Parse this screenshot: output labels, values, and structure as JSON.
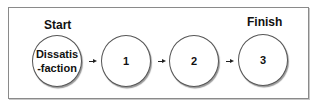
{
  "diagram": {
    "start_label": "Start",
    "finish_label": "Finish",
    "nodes": [
      {
        "id": "dissatisfaction",
        "label": "Dissatis\n-faction"
      },
      {
        "id": "step-1",
        "label": "1"
      },
      {
        "id": "step-2",
        "label": "2"
      },
      {
        "id": "step-3",
        "label": "3"
      }
    ],
    "edges": [
      {
        "from": "dissatisfaction",
        "to": "step-1"
      },
      {
        "from": "step-1",
        "to": "step-2"
      },
      {
        "from": "step-2",
        "to": "step-3"
      }
    ]
  }
}
